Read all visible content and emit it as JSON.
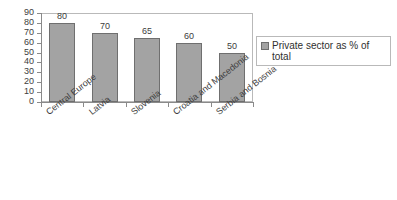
{
  "chart_data": {
    "type": "bar",
    "title": "",
    "subtitle": "",
    "xlabel": "",
    "ylabel": "",
    "categories": [
      "Central Europe",
      "Latvia",
      "Slovenia",
      "Croatia and Macedonia",
      "Serbia and Bosnia"
    ],
    "series": [
      {
        "name": "Private sector as % of total",
        "values": [
          80,
          70,
          65,
          60,
          50
        ]
      }
    ],
    "values": [
      80,
      70,
      65,
      60,
      50
    ],
    "data_labels": [
      "80",
      "70",
      "65",
      "60",
      "50"
    ],
    "ylim": [
      0,
      90
    ],
    "ytick_step": 10,
    "ytick_labels": [
      "90",
      "80",
      "70",
      "60",
      "50",
      "40",
      "30",
      "20",
      "10",
      "0"
    ],
    "grid": false,
    "legend_position": "right",
    "legend_entries": [
      "Private sector as % of total"
    ],
    "colors": {
      "bar_fill": "#a3a3a3",
      "bar_border": "#6f6f6f",
      "axis": "#8a8a8a",
      "frame": "#b9b9b9",
      "text": "#3d3d3d",
      "background": "#ffffff"
    }
  },
  "legend": {
    "label": "Private sector as % of total",
    "swatch_icon": "legend-swatch-icon"
  }
}
